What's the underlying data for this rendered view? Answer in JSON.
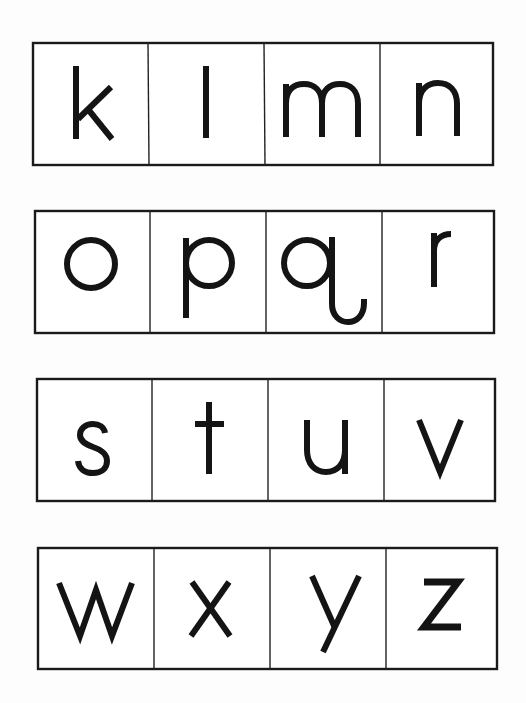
{
  "worksheet": {
    "rows": [
      {
        "letters": [
          "k",
          "l",
          "m",
          "n"
        ]
      },
      {
        "letters": [
          "o",
          "p",
          "q",
          "r"
        ]
      },
      {
        "letters": [
          "s",
          "t",
          "u",
          "v"
        ]
      },
      {
        "letters": [
          "w",
          "x",
          "y",
          "z"
        ]
      }
    ]
  },
  "colors": {
    "ink": "#141414",
    "paper": "#ffffff",
    "border": "#1a1a1a"
  }
}
